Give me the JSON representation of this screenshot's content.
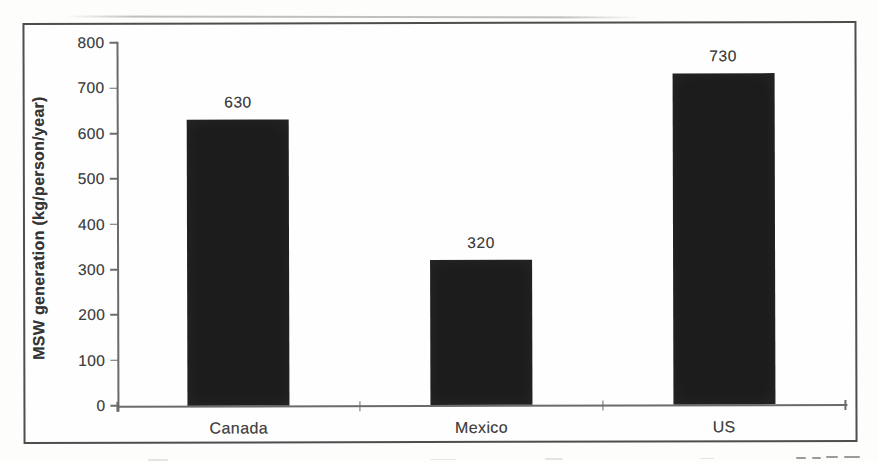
{
  "chart_data": {
    "type": "bar",
    "title": "",
    "xlabel": "",
    "ylabel": "MSW generation (kg/person/year)",
    "categories": [
      "Canada",
      "Mexico",
      "US"
    ],
    "values": [
      630,
      320,
      730
    ],
    "value_labels": [
      "630",
      "320",
      "730"
    ],
    "ylim": [
      0,
      800
    ],
    "ytick_step": 100,
    "ytick_labels": [
      "0",
      "100",
      "200",
      "300",
      "400",
      "500",
      "600",
      "700",
      "800"
    ],
    "grid": false,
    "legend": false,
    "bar_color": "#1c1c1c",
    "text_color": "#414141",
    "axis_color": "#6b6b6b",
    "frame_color": "#4e4e4e",
    "background_color": "#fefefe"
  }
}
